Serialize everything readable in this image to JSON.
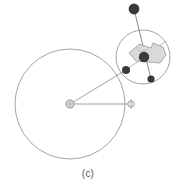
{
  "figure": {
    "caption": "(c)",
    "background_color": "#ffffff",
    "stroke_color": "#8c8c8c",
    "dark_marker_color": "#3a3a3a",
    "body_fill_color": "#d9d9d9",
    "hub_fill_color": "#d0d0d0",
    "elements": {
      "large_circle": {
        "name": "large-circle",
        "cx": 70,
        "cy": 104,
        "r": 55,
        "stroke": "#8c8c8c",
        "stroke_width": 0.8,
        "fill": "none"
      },
      "small_circle": {
        "name": "small-circle",
        "cx": 143,
        "cy": 57,
        "r": 27,
        "stroke": "#8c8c8c",
        "stroke_width": 0.8,
        "fill": "none"
      },
      "center_hub": {
        "name": "center-hub",
        "cx": 70,
        "cy": 104,
        "r": 4.2,
        "fill": "#d0d0d0",
        "stroke": "#8c8c8c"
      },
      "right_hub": {
        "name": "right-hub",
        "cx": 131,
        "cy": 104,
        "r": 3.2,
        "fill": "#e8e8e8",
        "stroke": "#8c8c8c"
      },
      "contact_marker": {
        "name": "contact-marker",
        "cx": 126,
        "cy": 70,
        "r": 4.0,
        "fill": "#3a3a3a"
      },
      "top_marker": {
        "name": "top-payload-marker",
        "cx": 134,
        "cy": 9,
        "r": 5.4,
        "fill": "#3a3a3a"
      },
      "center_marker": {
        "name": "body-center-marker",
        "cx": 144,
        "cy": 57,
        "r": 5.2,
        "fill": "#3a3a3a"
      },
      "lower_marker": {
        "name": "lower-contact-marker",
        "cx": 151,
        "cy": 79,
        "r": 3.6,
        "fill": "#3a3a3a"
      },
      "spoke_upper": {
        "name": "spoke-upper",
        "x1": 70,
        "y1": 104,
        "x2": 126,
        "y2": 70
      },
      "spoke_horizontal": {
        "name": "spoke-horizontal",
        "x1": 70,
        "y1": 104,
        "x2": 131,
        "y2": 104
      },
      "payload_rod": {
        "name": "payload-rod",
        "x1": 134,
        "y1": 9,
        "x2": 151,
        "y2": 79
      },
      "body_axis": {
        "name": "body-axis-line",
        "x1": 126,
        "y1": 70,
        "x2": 162,
        "y2": 44
      },
      "body_polygon": {
        "name": "body-polygon",
        "points": "129,53 136,47 139,44 151,48 153,43 163,47 166,55 160,63 136,61",
        "fill": "#d9d9d9",
        "stroke": "#9a9a9a"
      }
    }
  }
}
